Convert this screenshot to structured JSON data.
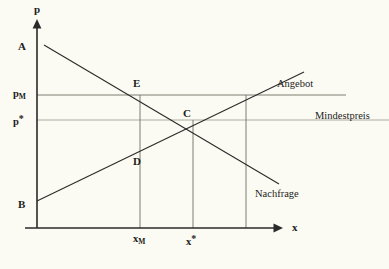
{
  "figure": {
    "kind": "supply-demand-price-floor-diagram",
    "background_color": "#fbfbf3",
    "ink_color": "#1c1c1c",
    "guide_color": "#8a8a7e"
  },
  "axes": {
    "y_axis_label": "p",
    "x_axis_label": "x",
    "y_axis_name": "price",
    "x_axis_name": "quantity",
    "origin_px": {
      "x": 37,
      "y": 228
    },
    "y_axis_top_px": 22,
    "x_axis_right_px": 282
  },
  "ticks": {
    "x": [
      {
        "id": "x_M",
        "label_main": "x",
        "label_sub": "M",
        "px": 140
      },
      {
        "id": "x_star",
        "label_main": "x",
        "label_star": "*",
        "px": 193
      }
    ],
    "y": [
      {
        "id": "p_M",
        "label_main": "p",
        "label_sub": "M",
        "px": 95
      },
      {
        "id": "p_star",
        "label_main": "p",
        "label_star": "*",
        "px": 120
      }
    ]
  },
  "curves": [
    {
      "id": "supply",
      "label": "Angebot",
      "label_px": {
        "x": 277,
        "y": 84
      },
      "from_px": {
        "x": 37,
        "y": 201
      },
      "to_px": {
        "x": 304,
        "y": 72
      }
    },
    {
      "id": "demand",
      "label": "Nachfrage",
      "label_px": {
        "x": 255,
        "y": 194
      },
      "from_px": {
        "x": 44,
        "y": 45
      },
      "to_px": {
        "x": 279,
        "y": 184
      }
    }
  ],
  "price_floor": {
    "id": "mindestpreis",
    "label": "Mindestpreis",
    "label_px": {
      "x": 315,
      "y": 116
    },
    "level_px_y": 95,
    "line_from_px_x": 37,
    "line_to_px_x": 346
  },
  "equilibrium_guide": {
    "id": "p-star-line",
    "level_px_y": 120,
    "line_from_px_x": 37,
    "line_to_px_x": 389
  },
  "points": [
    {
      "id": "A",
      "label": "A",
      "label_px": {
        "x": 18,
        "y": 41
      },
      "meaning": "demand-curve-intercept"
    },
    {
      "id": "B",
      "label": "B",
      "label_px": {
        "x": 18,
        "y": 199
      },
      "meaning": "supply-curve-intercept"
    },
    {
      "id": "E",
      "label": "E",
      "label_px": {
        "x": 133,
        "y": 84
      },
      "at_px": {
        "x": 140,
        "y": 95
      },
      "meaning": "demand-at-price-floor"
    },
    {
      "id": "C",
      "label": "C",
      "label_px": {
        "x": 183,
        "y": 108
      },
      "at_px": {
        "x": 193,
        "y": 120
      },
      "meaning": "market-equilibrium"
    },
    {
      "id": "D",
      "label": "D",
      "label_px": {
        "x": 133,
        "y": 159
      },
      "at_px": {
        "x": 140,
        "y": 148
      },
      "meaning": "supply-at-quantity-xM"
    }
  ],
  "drop_lines": [
    {
      "id": "xM-vertical",
      "x_px": 140,
      "y_from_px": 95,
      "y_to_px": 228
    },
    {
      "id": "xstar-vertical",
      "x_px": 193,
      "y_from_px": 120,
      "y_to_px": 228
    },
    {
      "id": "xC-vertical",
      "x_px": 246,
      "y_from_px": 95,
      "y_to_px": 228
    }
  ]
}
